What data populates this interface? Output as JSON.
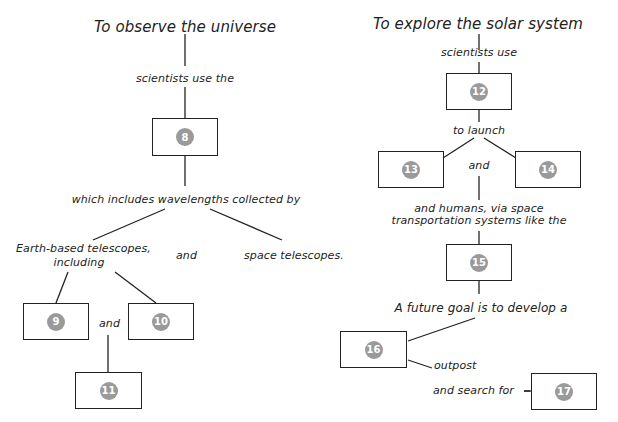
{
  "left_map": {
    "title": "To observe the universe",
    "step1": "scientists use the",
    "box8": "8",
    "step2": "which includes wavelengths collected by",
    "branch_left": "Earth-based telescopes,",
    "branch_left2": "including",
    "and_mid": "and",
    "branch_right": "space telescopes.",
    "box9": "9",
    "and_small": "and",
    "box10": "10",
    "box11": "11"
  },
  "right_map": {
    "title": "To explore the solar system",
    "step1": "scientists use",
    "box12": "12",
    "step2": "to launch",
    "box13": "13",
    "and_mid": "and",
    "box14": "14",
    "step3a": "and humans, via space",
    "step3b": "transportation systems like the",
    "box15": "15",
    "step4": "A future goal is to develop a",
    "box16": "16",
    "outpost": "outpost",
    "search": "and search for",
    "box17": "17"
  },
  "colors": {
    "badge": "#9a9a9a",
    "line": "#222222"
  }
}
